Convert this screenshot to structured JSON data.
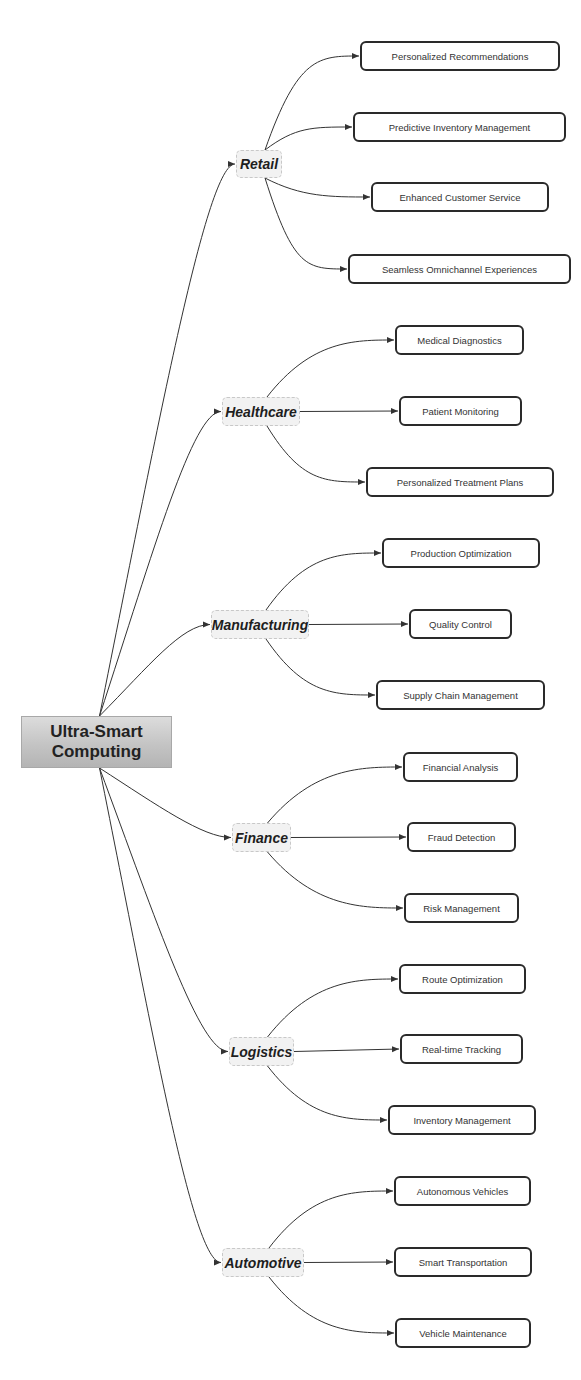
{
  "root": {
    "label": "Ultra-Smart Computing",
    "x": 21,
    "y": 716,
    "w": 151,
    "h": 52
  },
  "categories": [
    {
      "label": "Retail",
      "x": 236,
      "y": 150,
      "w": 46,
      "h": 28,
      "children": [
        {
          "label": "Personalized Recommendations",
          "x": 360,
          "y": 41,
          "w": 200,
          "h": 30
        },
        {
          "label": "Predictive Inventory Management",
          "x": 353,
          "y": 112,
          "w": 213,
          "h": 30
        },
        {
          "label": "Enhanced Customer Service",
          "x": 371,
          "y": 182,
          "w": 178,
          "h": 30
        },
        {
          "label": "Seamless Omnichannel Experiences",
          "x": 348,
          "y": 254,
          "w": 223,
          "h": 30
        }
      ]
    },
    {
      "label": "Healthcare",
      "x": 222,
      "y": 397,
      "w": 78,
      "h": 29,
      "children": [
        {
          "label": "Medical Diagnostics",
          "x": 395,
          "y": 325,
          "w": 129,
          "h": 30
        },
        {
          "label": "Patient Monitoring",
          "x": 399,
          "y": 396,
          "w": 123,
          "h": 30
        },
        {
          "label": "Personalized Treatment Plans",
          "x": 366,
          "y": 467,
          "w": 188,
          "h": 30
        }
      ]
    },
    {
      "label": "Manufacturing",
      "x": 211,
      "y": 610,
      "w": 98,
      "h": 29,
      "children": [
        {
          "label": "Production Optimization",
          "x": 382,
          "y": 538,
          "w": 158,
          "h": 30
        },
        {
          "label": "Quality Control",
          "x": 409,
          "y": 609,
          "w": 103,
          "h": 30
        },
        {
          "label": "Supply Chain Management",
          "x": 376,
          "y": 680,
          "w": 169,
          "h": 30
        }
      ]
    },
    {
      "label": "Finance",
      "x": 232,
      "y": 823,
      "w": 59,
      "h": 29,
      "children": [
        {
          "label": "Financial Analysis",
          "x": 403,
          "y": 752,
          "w": 115,
          "h": 30
        },
        {
          "label": "Fraud Detection",
          "x": 407,
          "y": 822,
          "w": 109,
          "h": 30
        },
        {
          "label": "Risk Management",
          "x": 404,
          "y": 893,
          "w": 115,
          "h": 30
        }
      ]
    },
    {
      "label": "Logistics",
      "x": 229,
      "y": 1037,
      "w": 65,
      "h": 29,
      "children": [
        {
          "label": "Route Optimization",
          "x": 399,
          "y": 964,
          "w": 127,
          "h": 30
        },
        {
          "label": "Real-time Tracking",
          "x": 400,
          "y": 1034,
          "w": 123,
          "h": 30
        },
        {
          "label": "Inventory Management",
          "x": 388,
          "y": 1105,
          "w": 148,
          "h": 30
        }
      ]
    },
    {
      "label": "Automotive",
      "x": 222,
      "y": 1248,
      "w": 82,
      "h": 29,
      "children": [
        {
          "label": "Autonomous Vehicles",
          "x": 394,
          "y": 1176,
          "w": 137,
          "h": 30
        },
        {
          "label": "Smart Transportation",
          "x": 394,
          "y": 1247,
          "w": 138,
          "h": 30
        },
        {
          "label": "Vehicle Maintenance",
          "x": 395,
          "y": 1318,
          "w": 136,
          "h": 30
        }
      ]
    }
  ],
  "colors": {
    "edge": "#333333",
    "leaf_border": "#2a2a2a",
    "category_fill": "#f2f2f2",
    "root_fill": "#c8c8c8"
  }
}
